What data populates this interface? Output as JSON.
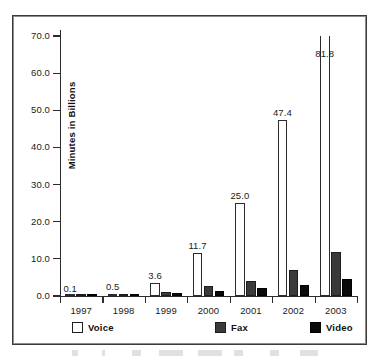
{
  "chart_data": {
    "type": "bar",
    "title": "",
    "xlabel": "",
    "ylabel": "Minutes in Billions",
    "categories": [
      "1997",
      "1998",
      "1999",
      "2000",
      "2001",
      "2002",
      "2003"
    ],
    "series": [
      {
        "name": "Voice",
        "color": "#ffffff",
        "values": [
          0.1,
          0.5,
          3.6,
          11.7,
          25.0,
          47.4,
          81.8
        ]
      },
      {
        "name": "Fax",
        "color": "#3a3a3a",
        "values": [
          0.1,
          0.4,
          1.0,
          2.6,
          4.1,
          7.0,
          11.9
        ]
      },
      {
        "name": "Video",
        "color": "#0a0a0a",
        "values": [
          0.05,
          0.3,
          0.8,
          1.4,
          2.2,
          3.1,
          4.6
        ]
      }
    ],
    "data_labels": {
      "series": "Voice",
      "values": [
        "0.1",
        "0.5",
        "3.6",
        "11.7",
        "25.0",
        "47.4",
        "81.8"
      ]
    },
    "yticks": [
      "0.0",
      "10.0",
      "20.0",
      "30.0",
      "40.0",
      "50.0",
      "60.0",
      "70.0"
    ],
    "ytick_values": [
      0,
      10,
      20,
      30,
      40,
      50,
      60,
      70
    ],
    "ylim": [
      0,
      70
    ],
    "grid": false,
    "legend_position": "bottom",
    "note": "The 2003 Voice bar (81.8) exceeds the 70.0 axis maximum and is clipped at the top of the plot frame."
  },
  "legend": {
    "items": [
      {
        "label": "Voice",
        "swatch": "voice"
      },
      {
        "label": "Fax",
        "swatch": "fax"
      },
      {
        "label": "Video",
        "swatch": "video"
      }
    ]
  }
}
